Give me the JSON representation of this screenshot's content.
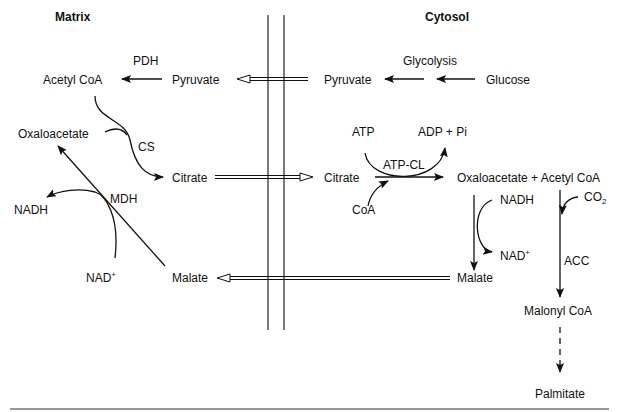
{
  "headers": {
    "matrix": "Matrix",
    "cytosol": "Cytosol"
  },
  "matrix": {
    "acetyl_coa": "Acetyl CoA",
    "pdh": "PDH",
    "pyruvate": "Pyruvate",
    "oxaloacetate": "Oxaloacetate",
    "cs": "CS",
    "citrate": "Citrate",
    "mdh": "MDH",
    "nadh": "NADH",
    "nad": "NAD",
    "nad_sup": "+",
    "malate": "Malate"
  },
  "cytosol": {
    "pyruvate": "Pyruvate",
    "glycolysis": "Glycolysis",
    "glucose": "Glucose",
    "atp": "ATP",
    "adp_pi": "ADP + Pi",
    "atp_cl": "ATP-CL",
    "citrate": "Citrate",
    "coa": "CoA",
    "oaa_acetyl": "Oxaloacetate + Acetyl CoA",
    "nadh": "NADH",
    "nad": "NAD",
    "nad_sup": "+",
    "co2": "CO",
    "co2_sub": "2",
    "acc": "ACC",
    "malate": "Malate",
    "malonyl_coa": "Malonyl CoA",
    "palmitate": "Palmitate"
  },
  "colors": {
    "ink": "#111111",
    "background": "#ffffff"
  }
}
